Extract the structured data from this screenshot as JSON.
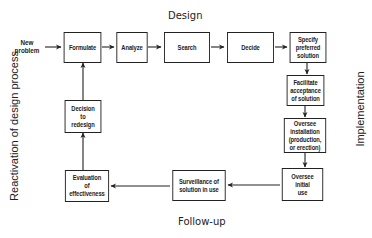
{
  "titles": {
    "top": "Design",
    "bottom": "Follow-up",
    "right": "Implementation",
    "left": "Reactivation of design process"
  },
  "input_label": "New\nproblem",
  "boxes": {
    "formulate": "Formulate",
    "analyze": "Analyze",
    "search": "Search",
    "decide": "Decide",
    "specify": "Specify\npreferred\nsolution",
    "facilitate": "Facilitate\nacceptance\nof solution",
    "installation": "Oversee\ninstallation\n(production,\nor erection)",
    "initial_use": "Oversee\ninitial\nuse",
    "surveillance": "Surveillance of\nsolution in use",
    "evaluation": "Evaluation\nof\neffectiveness",
    "redesign": "Decision\nto\nredesign"
  },
  "flow": [
    [
      "New problem",
      "Formulate"
    ],
    [
      "Formulate",
      "Analyze"
    ],
    [
      "Analyze",
      "Search"
    ],
    [
      "Search",
      "Decide"
    ],
    [
      "Decide",
      "Specify preferred solution"
    ],
    [
      "Specify preferred solution",
      "Facilitate acceptance of solution"
    ],
    [
      "Facilitate acceptance of solution",
      "Oversee installation (production, or erection)"
    ],
    [
      "Oversee installation (production, or erection)",
      "Oversee initial use"
    ],
    [
      "Oversee initial use",
      "Surveillance of solution in use"
    ],
    [
      "Surveillance of solution in use",
      "Evaluation of effectiveness"
    ],
    [
      "Evaluation of effectiveness",
      "Decision to redesign"
    ],
    [
      "Decision to redesign",
      "Formulate"
    ]
  ]
}
